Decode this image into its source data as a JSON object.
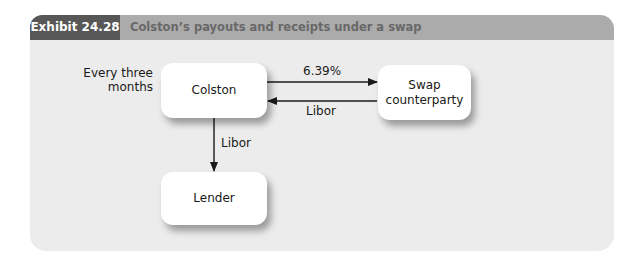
{
  "exhibit": {
    "label": "Exhibit 24.28",
    "title": "Colston’s payouts and receipts under a swap"
  },
  "diagram": {
    "nodes": [
      {
        "id": "colston",
        "label": "Colston"
      },
      {
        "id": "swap",
        "label": "Swap counterparty",
        "line1": "Swap",
        "line2": "counterparty"
      },
      {
        "id": "lender",
        "label": "Lender"
      }
    ],
    "annotation": {
      "line1": "Every three",
      "line2": "months"
    },
    "edges": [
      {
        "from": "colston",
        "to": "swap",
        "label": "6.39%"
      },
      {
        "from": "swap",
        "to": "colston",
        "label": "Libor"
      },
      {
        "from": "colston",
        "to": "lender",
        "label": "Libor"
      }
    ]
  },
  "colors": {
    "label_bg": "#575757",
    "header_bg": "#ababab",
    "panel_bg": "#ececec",
    "node_bg": "#ffffff",
    "arrow": "#1a1a1a"
  }
}
